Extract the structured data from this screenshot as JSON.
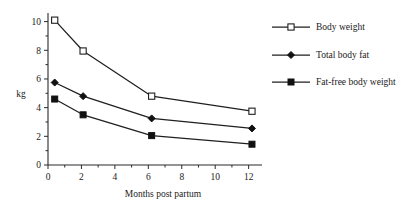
{
  "chart_data": {
    "type": "line",
    "title": "",
    "subtitle": "",
    "xlabel": "Months post partum",
    "ylabel": "kg",
    "xlim": [
      0,
      12.8
    ],
    "ylim": [
      0,
      10.6
    ],
    "grid": false,
    "legend_position": "right",
    "x_ticks": [
      0,
      2,
      4,
      6,
      8,
      10,
      12
    ],
    "x_tick_labels": [
      "0",
      "2",
      "4",
      "6",
      "8",
      "10",
      "12"
    ],
    "x_minor_ticks": [
      1,
      3,
      5,
      7,
      9,
      11
    ],
    "y_ticks": [
      0,
      2,
      4,
      6,
      8,
      10
    ],
    "y_tick_labels": [
      "0",
      "2",
      "4",
      "6",
      "8",
      "10"
    ],
    "y_minor_ticks": [
      1,
      3,
      5,
      7,
      9
    ],
    "x": [
      0.4,
      2.1,
      6.2,
      12.2
    ],
    "series": [
      {
        "name": "Body weight",
        "marker": "open-square",
        "values": [
          10.1,
          7.95,
          4.8,
          3.75
        ]
      },
      {
        "name": "Total body fat",
        "marker": "filled-diamond",
        "values": [
          5.75,
          4.8,
          3.25,
          2.55
        ]
      },
      {
        "name": "Fat-free body weight",
        "marker": "filled-square",
        "values": [
          4.6,
          3.5,
          2.05,
          1.45
        ]
      }
    ],
    "colors": {
      "line": "#1f1f1f",
      "axis": "#2b2b2b",
      "text": "#1a1a1a",
      "background": "#ffffff"
    }
  },
  "legend": {
    "entries": [
      {
        "label": "Body weight"
      },
      {
        "label": "Total body fat"
      },
      {
        "label": "Fat-free body weight"
      }
    ]
  }
}
